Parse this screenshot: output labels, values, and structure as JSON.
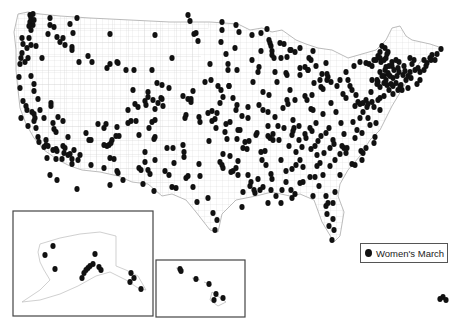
{
  "legend": {
    "label": "Women's March",
    "marker": "filled-circle",
    "color": "#111111"
  },
  "colors": {
    "dot": "#111111",
    "boundary": "#c8c8c8",
    "outline": "#aaaaaa",
    "inset_border": "#444444"
  },
  "insets": [
    {
      "name": "alaska",
      "x": 13,
      "y": 211,
      "w": 140,
      "h": 105
    },
    {
      "name": "hawaii",
      "x": 156,
      "y": 260,
      "w": 89,
      "h": 57
    }
  ],
  "points": [
    [
      30,
      15
    ],
    [
      33,
      14
    ],
    [
      31,
      18
    ],
    [
      34,
      20
    ],
    [
      30,
      22
    ],
    [
      33,
      25
    ],
    [
      29,
      26
    ],
    [
      31,
      30
    ],
    [
      50,
      18
    ],
    [
      50,
      25
    ],
    [
      48,
      34
    ],
    [
      54,
      27
    ],
    [
      70,
      24
    ],
    [
      77,
      18
    ],
    [
      73,
      33
    ],
    [
      57,
      37
    ],
    [
      60,
      42
    ],
    [
      63,
      38
    ],
    [
      65,
      45
    ],
    [
      72,
      47
    ],
    [
      72,
      50
    ],
    [
      22,
      38
    ],
    [
      23,
      44
    ],
    [
      29,
      38
    ],
    [
      31,
      45
    ],
    [
      27,
      48
    ],
    [
      36,
      46
    ],
    [
      22,
      53
    ],
    [
      21,
      58
    ],
    [
      25,
      62
    ],
    [
      28,
      58
    ],
    [
      20,
      64
    ],
    [
      42,
      58
    ],
    [
      79,
      62
    ],
    [
      88,
      56
    ],
    [
      92,
      62
    ],
    [
      107,
      68
    ],
    [
      110,
      34
    ],
    [
      110,
      64
    ],
    [
      117,
      62
    ],
    [
      118,
      63
    ],
    [
      126,
      70
    ],
    [
      134,
      70
    ],
    [
      152,
      70
    ],
    [
      155,
      35
    ],
    [
      172,
      58
    ],
    [
      19,
      77
    ],
    [
      31,
      76
    ],
    [
      20,
      88
    ],
    [
      34,
      84
    ],
    [
      34,
      91
    ],
    [
      23,
      101
    ],
    [
      26,
      106
    ],
    [
      38,
      99
    ],
    [
      27,
      110
    ],
    [
      51,
      103
    ],
    [
      40,
      110
    ],
    [
      32,
      112
    ],
    [
      34,
      114
    ],
    [
      35,
      118
    ],
    [
      34,
      121
    ],
    [
      36,
      128
    ],
    [
      44,
      118
    ],
    [
      51,
      106
    ],
    [
      58,
      117
    ],
    [
      53,
      123
    ],
    [
      63,
      121
    ],
    [
      54,
      129
    ],
    [
      56,
      132
    ],
    [
      98,
      124
    ],
    [
      106,
      124
    ],
    [
      86,
      133
    ],
    [
      68,
      137
    ],
    [
      46,
      140
    ],
    [
      48,
      146
    ],
    [
      53,
      150
    ],
    [
      56,
      149
    ],
    [
      57,
      151
    ],
    [
      63,
      146
    ],
    [
      65,
      148
    ],
    [
      64,
      153
    ],
    [
      68,
      155
    ],
    [
      70,
      154
    ],
    [
      72,
      159
    ],
    [
      72,
      164
    ],
    [
      78,
      160
    ],
    [
      91,
      165
    ],
    [
      104,
      168
    ],
    [
      107,
      146
    ],
    [
      109,
      145
    ],
    [
      111,
      143
    ],
    [
      112,
      140
    ],
    [
      110,
      158
    ],
    [
      114,
      159
    ],
    [
      117,
      171
    ],
    [
      118,
      173
    ],
    [
      128,
      110
    ],
    [
      128,
      123
    ],
    [
      133,
      90
    ],
    [
      135,
      104
    ],
    [
      136,
      121
    ],
    [
      138,
      107
    ],
    [
      145,
      101
    ],
    [
      146,
      105
    ],
    [
      148,
      92
    ],
    [
      148,
      97
    ],
    [
      153,
      100
    ],
    [
      155,
      109
    ],
    [
      155,
      120
    ],
    [
      157,
      83
    ],
    [
      162,
      85
    ],
    [
      162,
      99
    ],
    [
      163,
      106
    ],
    [
      149,
      128
    ],
    [
      155,
      137
    ],
    [
      154,
      139
    ],
    [
      145,
      162
    ],
    [
      141,
      170
    ],
    [
      148,
      170
    ],
    [
      150,
      174
    ],
    [
      167,
      148
    ],
    [
      169,
      88
    ],
    [
      183,
      145
    ],
    [
      184,
      157
    ],
    [
      199,
      164
    ],
    [
      200,
      176
    ],
    [
      209,
      141
    ],
    [
      216,
      128
    ],
    [
      221,
      42
    ],
    [
      222,
      30
    ],
    [
      222,
      22
    ],
    [
      226,
      54
    ],
    [
      228,
      64
    ],
    [
      228,
      70
    ],
    [
      229,
      86
    ],
    [
      235,
      48
    ],
    [
      236,
      25
    ],
    [
      239,
      32
    ],
    [
      233,
      98
    ],
    [
      229,
      86
    ],
    [
      237,
      70
    ],
    [
      237,
      105
    ],
    [
      238,
      161
    ],
    [
      236,
      110
    ],
    [
      230,
      122
    ],
    [
      230,
      156
    ],
    [
      237,
      139
    ],
    [
      243,
      148
    ],
    [
      240,
      130
    ],
    [
      238,
      130
    ],
    [
      236,
      168
    ],
    [
      238,
      175
    ],
    [
      250,
      186
    ],
    [
      260,
      190
    ],
    [
      243,
      192
    ],
    [
      255,
      193
    ],
    [
      208,
      198
    ],
    [
      213,
      213
    ],
    [
      217,
      220
    ],
    [
      222,
      165
    ],
    [
      220,
      162
    ],
    [
      223,
      168
    ],
    [
      233,
      171
    ],
    [
      248,
      175
    ],
    [
      266,
      165
    ],
    [
      271,
      174
    ],
    [
      272,
      179
    ],
    [
      276,
      196
    ],
    [
      291,
      190
    ],
    [
      295,
      194
    ],
    [
      303,
      182
    ],
    [
      310,
      177
    ],
    [
      303,
      167
    ],
    [
      300,
      160
    ],
    [
      273,
      140
    ],
    [
      284,
      128
    ],
    [
      293,
      120
    ],
    [
      287,
      100
    ],
    [
      290,
      90
    ],
    [
      287,
      75
    ],
    [
      277,
      82
    ],
    [
      275,
      72
    ],
    [
      287,
      57
    ],
    [
      290,
      50
    ],
    [
      291,
      50
    ],
    [
      252,
      35
    ],
    [
      261,
      33
    ],
    [
      267,
      29
    ],
    [
      270,
      43
    ],
    [
      272,
      55
    ],
    [
      261,
      51
    ],
    [
      274,
      58
    ],
    [
      286,
      73
    ],
    [
      252,
      60
    ],
    [
      259,
      67
    ],
    [
      258,
      72
    ],
    [
      253,
      82
    ],
    [
      263,
      92
    ],
    [
      269,
      95
    ],
    [
      259,
      105
    ],
    [
      248,
      107
    ],
    [
      263,
      110
    ],
    [
      242,
      116
    ],
    [
      248,
      118
    ],
    [
      268,
      112
    ],
    [
      275,
      117
    ],
    [
      268,
      126
    ],
    [
      278,
      126
    ],
    [
      283,
      108
    ],
    [
      288,
      104
    ],
    [
      295,
      100
    ],
    [
      305,
      96
    ],
    [
      312,
      95
    ],
    [
      311,
      109
    ],
    [
      313,
      110
    ],
    [
      323,
      114
    ],
    [
      336,
      112
    ],
    [
      316,
      123
    ],
    [
      312,
      131
    ],
    [
      310,
      128
    ],
    [
      321,
      136
    ],
    [
      326,
      133
    ],
    [
      329,
      128
    ],
    [
      324,
      153
    ],
    [
      330,
      148
    ],
    [
      334,
      144
    ],
    [
      342,
      146
    ],
    [
      344,
      148
    ],
    [
      347,
      148
    ],
    [
      333,
      140
    ],
    [
      318,
      141
    ],
    [
      335,
      160
    ],
    [
      346,
      153
    ],
    [
      352,
      164
    ],
    [
      330,
      166
    ],
    [
      340,
      175
    ],
    [
      361,
      151
    ],
    [
      363,
      153
    ],
    [
      366,
      148
    ],
    [
      374,
      143
    ],
    [
      375,
      137
    ],
    [
      376,
      123
    ],
    [
      370,
      125
    ],
    [
      367,
      107
    ],
    [
      374,
      107
    ],
    [
      380,
      110
    ],
    [
      358,
      102
    ],
    [
      360,
      104
    ],
    [
      363,
      103
    ],
    [
      366,
      100
    ],
    [
      356,
      95
    ],
    [
      352,
      90
    ],
    [
      350,
      86
    ],
    [
      348,
      80
    ],
    [
      340,
      80
    ],
    [
      328,
      77
    ],
    [
      322,
      74
    ],
    [
      320,
      80
    ],
    [
      316,
      66
    ],
    [
      308,
      70
    ],
    [
      305,
      67
    ],
    [
      311,
      60
    ],
    [
      309,
      58
    ],
    [
      313,
      51
    ],
    [
      300,
      48
    ],
    [
      295,
      52
    ],
    [
      280,
      43
    ],
    [
      284,
      44
    ],
    [
      272,
      51
    ],
    [
      269,
      40
    ],
    [
      271,
      46
    ],
    [
      281,
      58
    ],
    [
      300,
      75
    ],
    [
      308,
      70
    ],
    [
      314,
      83
    ],
    [
      321,
      87
    ],
    [
      323,
      89
    ],
    [
      346,
      72
    ],
    [
      354,
      66
    ],
    [
      360,
      62
    ],
    [
      366,
      63
    ],
    [
      369,
      64
    ],
    [
      372,
      66
    ],
    [
      374,
      60
    ],
    [
      376,
      60
    ],
    [
      378,
      56
    ],
    [
      380,
      58
    ],
    [
      381,
      62
    ],
    [
      384,
      60
    ],
    [
      386,
      58
    ],
    [
      387,
      54
    ],
    [
      388,
      52
    ],
    [
      389,
      66
    ],
    [
      392,
      66
    ],
    [
      394,
      70
    ],
    [
      388,
      74
    ],
    [
      384,
      76
    ],
    [
      382,
      76
    ],
    [
      380,
      72
    ],
    [
      377,
      80
    ],
    [
      378,
      82
    ],
    [
      384,
      83
    ],
    [
      387,
      85
    ],
    [
      391,
      84
    ],
    [
      393,
      86
    ],
    [
      393,
      94
    ],
    [
      384,
      96
    ],
    [
      380,
      98
    ],
    [
      378,
      100
    ],
    [
      372,
      102
    ],
    [
      368,
      104
    ],
    [
      371,
      92
    ],
    [
      372,
      80
    ],
    [
      377,
      84
    ],
    [
      380,
      87
    ],
    [
      386,
      80
    ],
    [
      389,
      90
    ],
    [
      398,
      90
    ],
    [
      401,
      85
    ],
    [
      403,
      75
    ],
    [
      406,
      80
    ],
    [
      405,
      71
    ],
    [
      408,
      76
    ],
    [
      410,
      72
    ],
    [
      412,
      64
    ],
    [
      414,
      60
    ],
    [
      410,
      58
    ],
    [
      415,
      70
    ],
    [
      420,
      72
    ],
    [
      424,
      70
    ],
    [
      420,
      80
    ],
    [
      417,
      84
    ],
    [
      418,
      68
    ],
    [
      426,
      66
    ],
    [
      424,
      60
    ],
    [
      427,
      63
    ],
    [
      430,
      58
    ],
    [
      432,
      55
    ],
    [
      431,
      60
    ],
    [
      435,
      60
    ],
    [
      437,
      54
    ],
    [
      441,
      49
    ],
    [
      400,
      86
    ],
    [
      402,
      90
    ],
    [
      408,
      88
    ],
    [
      411,
      78
    ],
    [
      393,
      78
    ],
    [
      397,
      76
    ],
    [
      399,
      72
    ],
    [
      404,
      66
    ],
    [
      396,
      60
    ],
    [
      392,
      62
    ],
    [
      386,
      67
    ],
    [
      385,
      70
    ],
    [
      388,
      73
    ],
    [
      390,
      76
    ],
    [
      396,
      83
    ],
    [
      380,
      52
    ],
    [
      385,
      48
    ],
    [
      382,
      46
    ],
    [
      399,
      62
    ],
    [
      398,
      68
    ],
    [
      343,
      94
    ],
    [
      346,
      98
    ],
    [
      326,
      63
    ],
    [
      327,
      74
    ],
    [
      327,
      80
    ],
    [
      331,
      82
    ],
    [
      337,
      86
    ],
    [
      331,
      103
    ],
    [
      341,
      123
    ],
    [
      307,
      100
    ],
    [
      300,
      68
    ],
    [
      333,
      203
    ],
    [
      333,
      219
    ],
    [
      335,
      192
    ],
    [
      332,
      240
    ],
    [
      334,
      230
    ],
    [
      329,
      226
    ],
    [
      327,
      214
    ],
    [
      326,
      206
    ],
    [
      328,
      203
    ],
    [
      326,
      196
    ],
    [
      319,
      186
    ],
    [
      313,
      196
    ],
    [
      300,
      183
    ],
    [
      292,
      198
    ],
    [
      281,
      203
    ],
    [
      268,
      203
    ],
    [
      254,
      190
    ],
    [
      242,
      207
    ],
    [
      215,
      230
    ],
    [
      197,
      202
    ],
    [
      193,
      187
    ],
    [
      176,
      188
    ],
    [
      154,
      191
    ],
    [
      143,
      184
    ],
    [
      172,
      187
    ],
    [
      169,
      175
    ],
    [
      165,
      171
    ],
    [
      155,
      160
    ],
    [
      145,
      152
    ],
    [
      139,
      168
    ],
    [
      123,
      180
    ],
    [
      110,
      185
    ],
    [
      77,
      189
    ],
    [
      57,
      180
    ],
    [
      50,
      175
    ],
    [
      47,
      158
    ],
    [
      38,
      137
    ],
    [
      28,
      126
    ],
    [
      21,
      118
    ],
    [
      39,
      142
    ],
    [
      44,
      147
    ],
    [
      46,
      145
    ],
    [
      56,
      159
    ],
    [
      62,
      159
    ],
    [
      74,
      150
    ],
    [
      80,
      155
    ],
    [
      89,
      140
    ],
    [
      91,
      140
    ],
    [
      104,
      145
    ],
    [
      104,
      128
    ],
    [
      116,
      136
    ],
    [
      119,
      136
    ],
    [
      117,
      127
    ],
    [
      131,
      121
    ],
    [
      139,
      135
    ],
    [
      152,
      122
    ],
    [
      158,
      103
    ],
    [
      161,
      98
    ],
    [
      183,
      96
    ],
    [
      188,
      99
    ],
    [
      191,
      102
    ],
    [
      211,
      80
    ],
    [
      210,
      64
    ],
    [
      198,
      41
    ],
    [
      196,
      33
    ],
    [
      190,
      21
    ],
    [
      188,
      15
    ],
    [
      194,
      34
    ],
    [
      205,
      82
    ],
    [
      221,
      90
    ],
    [
      223,
      97
    ],
    [
      217,
      113
    ],
    [
      220,
      103
    ],
    [
      218,
      86
    ],
    [
      215,
      119
    ],
    [
      212,
      121
    ],
    [
      200,
      122
    ],
    [
      199,
      117
    ],
    [
      193,
      91
    ],
    [
      191,
      99
    ],
    [
      186,
      115
    ],
    [
      185,
      118
    ],
    [
      184,
      152
    ],
    [
      173,
      148
    ],
    [
      174,
      163
    ],
    [
      186,
      178
    ],
    [
      188,
      176
    ],
    [
      212,
      111
    ],
    [
      208,
      113
    ],
    [
      225,
      132
    ],
    [
      226,
      124
    ],
    [
      227,
      139
    ],
    [
      223,
      154
    ],
    [
      231,
      172
    ],
    [
      245,
      142
    ],
    [
      247,
      149
    ],
    [
      249,
      141
    ],
    [
      256,
      135
    ],
    [
      257,
      133
    ],
    [
      261,
      152
    ],
    [
      262,
      160
    ],
    [
      265,
      151
    ],
    [
      268,
      136
    ],
    [
      270,
      138
    ],
    [
      273,
      134
    ],
    [
      279,
      140
    ],
    [
      281,
      160
    ],
    [
      286,
      171
    ],
    [
      286,
      182
    ],
    [
      289,
      146
    ],
    [
      292,
      135
    ],
    [
      293,
      131
    ],
    [
      294,
      128
    ],
    [
      299,
      126
    ],
    [
      305,
      134
    ],
    [
      306,
      138
    ],
    [
      311,
      149
    ],
    [
      315,
      146
    ],
    [
      317,
      155
    ],
    [
      320,
      163
    ],
    [
      317,
      166
    ],
    [
      323,
      175
    ],
    [
      315,
      177
    ],
    [
      302,
      147
    ],
    [
      299,
      140
    ],
    [
      296,
      152
    ],
    [
      296,
      165
    ],
    [
      292,
      169
    ],
    [
      282,
      190
    ],
    [
      271,
      190
    ],
    [
      263,
      187
    ],
    [
      251,
      182
    ],
    [
      258,
      179
    ],
    [
      340,
      154
    ],
    [
      355,
      165
    ],
    [
      362,
      160
    ],
    [
      368,
      118
    ],
    [
      360,
      118
    ],
    [
      353,
      122
    ],
    [
      344,
      134
    ],
    [
      355,
      138
    ],
    [
      357,
      130
    ],
    [
      362,
      133
    ],
    [
      363,
      112
    ],
    [
      355,
      106
    ]
  ],
  "alaska_points": [
    [
      53,
      246
    ],
    [
      45,
      255
    ],
    [
      55,
      269
    ],
    [
      95,
      254
    ],
    [
      90,
      266
    ],
    [
      93,
      264
    ],
    [
      88,
      268
    ],
    [
      86,
      270
    ],
    [
      84,
      273
    ],
    [
      82,
      278
    ],
    [
      99,
      267
    ],
    [
      101,
      270
    ],
    [
      131,
      273
    ],
    [
      134,
      278
    ],
    [
      130,
      282
    ],
    [
      141,
      289
    ]
  ],
  "hawaii_points": [
    [
      180,
      269
    ],
    [
      181,
      271
    ],
    [
      196,
      279
    ],
    [
      209,
      284
    ],
    [
      216,
      294
    ],
    [
      214,
      300
    ],
    [
      223,
      298
    ]
  ],
  "extra_points": [
    [
      440,
      299
    ],
    [
      443,
      297
    ],
    [
      446,
      300
    ]
  ]
}
